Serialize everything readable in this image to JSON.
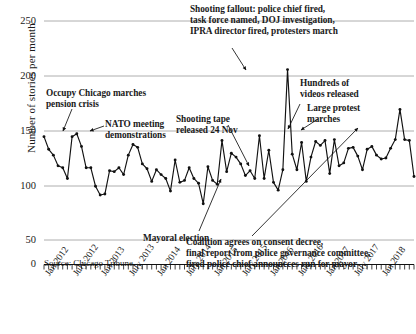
{
  "chart_data": {
    "type": "line",
    "title": "",
    "xlabel": "",
    "ylabel": "Number of stories per month",
    "ylim": [
      0,
      250
    ],
    "yticks": [
      0,
      50,
      100,
      150,
      200,
      250
    ],
    "grid": true,
    "legend": false,
    "source": "Source: Chicago Tribune",
    "xtick_labels": [
      "Jan 2012",
      "July 2012",
      "Jan 2013",
      "July 2013",
      "Jan 2014",
      "July 2014",
      "Jan 2015",
      "July 2015",
      "Jan 2016",
      "July 2016",
      "Jan 2017",
      "July 2017",
      "Jan 2018"
    ],
    "x_start": "Jan 2012",
    "x_end": "Dec 2018",
    "n_points": 79,
    "series": [
      {
        "name": "Stories per month",
        "color": "#111111",
        "values": [
          131,
          118,
          112,
          101,
          99,
          88,
          131,
          134,
          121,
          99,
          99,
          80,
          71,
          72,
          96,
          95,
          99,
          92,
          112,
          123,
          120,
          103,
          98,
          85,
          97,
          92,
          88,
          75,
          107,
          84,
          86,
          99,
          88,
          83,
          62,
          100,
          86,
          82,
          127,
          95,
          114,
          110,
          103,
          91,
          96,
          88,
          132,
          88,
          117,
          84,
          76,
          97,
          200,
          113,
          97,
          125,
          85,
          110,
          126,
          122,
          127,
          93,
          128,
          101,
          104,
          119,
          120,
          111,
          97,
          118,
          121,
          112,
          108,
          109,
          119,
          128,
          159,
          128,
          127,
          90
        ]
      }
    ],
    "annotations": [
      {
        "id": "occupy-chicago",
        "lines": [
          "Occupy Chicago marches",
          "pension crisis"
        ],
        "x_pct": 13.5,
        "y_px": 88
      },
      {
        "id": "nato-meeting",
        "lines": [
          "NATO meeting",
          "demonstrations"
        ],
        "x_pct": 26.0,
        "y_px": 119
      },
      {
        "id": "shooting-tape",
        "lines": [
          "Shooting tape",
          "released 24 Nov"
        ],
        "x_pct": 44.0,
        "y_px": 114
      },
      {
        "id": "shooting-fallout",
        "lines": [
          "Shooting fallout: police chief fired,",
          "task force named, DOJ investigation,",
          "IPRA director fired, protesters march"
        ],
        "x_pct": 48.0,
        "y_px": 4
      },
      {
        "id": "hundreds-of-videos",
        "lines": [
          "Hundreds of",
          "videos released"
        ],
        "x_pct": 70.0,
        "y_px": 78
      },
      {
        "id": "large-protest",
        "lines": [
          "Large protest",
          "marches"
        ],
        "x_pct": 82.5,
        "y_px": 103
      },
      {
        "id": "mayoral-election",
        "lines": [
          "Mayoral election"
        ],
        "x_pct": 36.0,
        "y_px": 233
      },
      {
        "id": "coalition-consent-decree",
        "lines": [
          "Coalition agrees on consent decree,",
          "final report from police governance committee,",
          "fired police chief announcces run for mayor"
        ],
        "x_pct": 60.0,
        "y_px": 237
      }
    ]
  }
}
